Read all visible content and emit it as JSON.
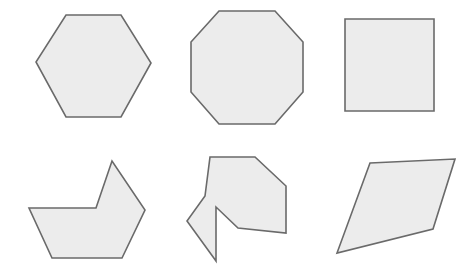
{
  "canvas": {
    "width": 476,
    "height": 274,
    "background_color": "#ffffff",
    "title": "Geometric shapes figure"
  },
  "style": {
    "fill_color": "#ececec",
    "stroke_color": "#6a6a6a",
    "stroke_width": 1.6
  },
  "shapes": [
    {
      "id": "hexagon",
      "name": "regular-hexagon",
      "row": 1,
      "column": 1,
      "sides": 6,
      "convex": true,
      "points": "66,15 121,15 151,63 121,117 66,117 36,62",
      "bbox": [
        36,
        15,
        115,
        102
      ]
    },
    {
      "id": "octagon",
      "name": "regular-octagon",
      "row": 1,
      "column": 2,
      "sides": 8,
      "convex": true,
      "points": "219,11 275,11 303,42 303,92 275,124 219,124 191,92 191,42",
      "bbox": [
        191,
        11,
        112,
        113
      ]
    },
    {
      "id": "square",
      "name": "square",
      "row": 1,
      "column": 3,
      "sides": 4,
      "convex": true,
      "points": "345,19 434,19 434,111 345,111",
      "bbox": [
        345,
        19,
        89,
        92
      ]
    },
    {
      "id": "concave-boat",
      "name": "concave-hexagon-notched",
      "row": 2,
      "column": 1,
      "sides": 6,
      "convex": false,
      "points": "29,208 96,208 112,161 145,210 122,258 52,258",
      "bbox": [
        29,
        161,
        116,
        97
      ]
    },
    {
      "id": "concave-arrow",
      "name": "concave-arrow-polygon",
      "row": 2,
      "column": 2,
      "sides": 9,
      "convex": false,
      "points": "210,157 255,157 286,186 286,233 238,228 216,207 216,261 187,221 205,196",
      "bbox": [
        187,
        157,
        99,
        104
      ]
    },
    {
      "id": "quadrilateral",
      "name": "slanted-quadrilateral",
      "row": 2,
      "column": 3,
      "sides": 4,
      "convex": true,
      "points": "370,163 455,159 433,229 337,253",
      "bbox": [
        337,
        159,
        118,
        94
      ]
    }
  ]
}
